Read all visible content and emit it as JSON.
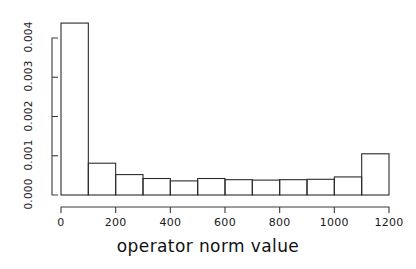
{
  "chart_data": {
    "type": "bar",
    "title": "",
    "subtitle": "",
    "xlabel": "operator norm value",
    "ylabel": "",
    "grid": false,
    "legend": false,
    "legend_position": "none",
    "bin_width": 100,
    "xlim": [
      0,
      1200
    ],
    "ylim": [
      0,
      0.0045
    ],
    "xticks": [
      0,
      200,
      400,
      600,
      800,
      1000,
      1200
    ],
    "xtick_labels": [
      "0",
      "200",
      "400",
      "600",
      "800",
      "1000",
      "1200"
    ],
    "yticks": [
      0.0,
      0.001,
      0.002,
      0.003,
      0.004
    ],
    "ytick_labels": [
      "0.000",
      "0.001",
      "0.002",
      "0.003",
      "0.004"
    ],
    "categories": [
      "0-100",
      "100-200",
      "200-300",
      "300-400",
      "400-500",
      "500-600",
      "600-700",
      "700-800",
      "800-900",
      "900-1000",
      "1000-1100",
      "1100-1200"
    ],
    "bin_starts": [
      0,
      100,
      200,
      300,
      400,
      500,
      600,
      700,
      800,
      900,
      1000,
      1100
    ],
    "bin_ends": [
      100,
      200,
      300,
      400,
      500,
      600,
      700,
      800,
      900,
      1000,
      1100,
      1200
    ],
    "values": [
      0.00438,
      0.00081,
      0.00052,
      0.00042,
      0.00036,
      0.00042,
      0.00039,
      0.00038,
      0.00039,
      0.0004,
      0.00046,
      0.00105
    ]
  },
  "axis": {
    "x_label_text": "operator norm value"
  }
}
